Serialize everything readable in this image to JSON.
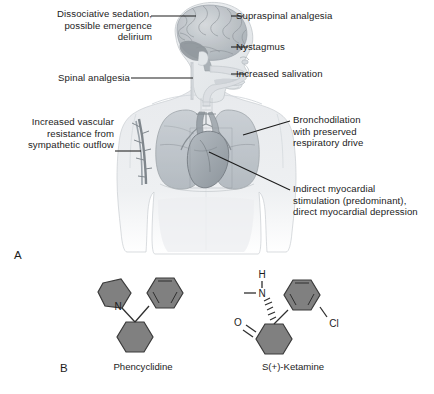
{
  "figure": {
    "background_color": "#ffffff",
    "panels": [
      {
        "letter": "A",
        "name": "anatomical-effects-diagram"
      },
      {
        "letter": "B",
        "name": "chemical-structures"
      }
    ]
  },
  "panel_a": {
    "letter": "A",
    "labels_left": [
      {
        "id": "dissociative-sedation",
        "text": "Dissociative sedation,\npossible emergence\ndelirium",
        "target": "brain"
      },
      {
        "id": "spinal-analgesia",
        "text": "Spinal analgesia",
        "target": "spinal-cord"
      },
      {
        "id": "increased-vascular-resistance",
        "text": "Increased vascular\nresistance from\nsympathetic outflow",
        "target": "brachial-vessel"
      }
    ],
    "labels_right": [
      {
        "id": "supraspinal-analgesia",
        "text": "Supraspinal analgesia",
        "target": "cerebral-cortex"
      },
      {
        "id": "nystagmus",
        "text": "Nystagmus",
        "target": "eye"
      },
      {
        "id": "increased-salivation",
        "text": "Increased salivation",
        "target": "mouth"
      },
      {
        "id": "bronchodilation",
        "text": "Bronchodilation\nwith preserved\nrespiratory drive",
        "target": "lung"
      },
      {
        "id": "indirect-myocardial-stimulation",
        "text": "Indirect myocardial\nstimulation (predominant),\ndirect myocardial depression",
        "target": "heart"
      }
    ],
    "anatomy_parts": [
      "brain",
      "head-profile",
      "airway",
      "trachea",
      "left-lung",
      "right-lung",
      "heart",
      "aorta",
      "brachial-vessel",
      "torso",
      "shoulders",
      "arms"
    ]
  },
  "panel_b": {
    "letter": "B",
    "structures": [
      {
        "id": "phencyclidine",
        "caption": "Phencyclidine",
        "atom_labels": [
          "N"
        ],
        "rings": [
          "piperidine",
          "phenyl",
          "cyclohexyl"
        ]
      },
      {
        "id": "s-plus-ketamine",
        "caption": "S(+)-Ketamine",
        "atom_labels": [
          "H",
          "N",
          "O",
          "Cl"
        ],
        "rings": [
          "chlorophenyl",
          "cyclohexanone"
        ]
      }
    ]
  },
  "colors": {
    "text": "#1c1c1c",
    "leader_line": "#1c1c1c",
    "body_fill": "#eceef0",
    "body_stroke": "#c3c8cc",
    "brain_fill": "#c9ced3",
    "brain_dark": "#8e959b",
    "lung_fill": "#b9bfc5",
    "heart_fill": "#9aa2a9",
    "vessel_fill": "#8e959b",
    "ring_fill": "#808080",
    "ring_stroke": "#3a3a3a"
  }
}
